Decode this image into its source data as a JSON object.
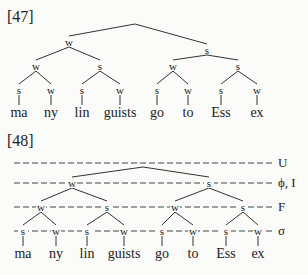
{
  "examples": [
    {
      "label": "[47]",
      "word": [
        "ma",
        "ny",
        "lin",
        "guists",
        "go",
        "to",
        "Ess",
        "ex"
      ],
      "tree": {
        "root": {
          "x": 135,
          "y": 24
        },
        "level1": [
          {
            "label": "w",
            "x": 69,
            "y": 42
          },
          {
            "label": "s",
            "x": 207,
            "y": 50
          }
        ],
        "level2": [
          {
            "label": "w",
            "x": 36,
            "y": 66
          },
          {
            "label": "s",
            "x": 100,
            "y": 66
          },
          {
            "label": "w",
            "x": 173,
            "y": 66
          },
          {
            "label": "s",
            "x": 238,
            "y": 66
          }
        ],
        "level3": [
          {
            "label": "s",
            "x": 19,
            "y": 90
          },
          {
            "label": "w",
            "x": 51,
            "y": 90
          },
          {
            "label": "s",
            "x": 82,
            "y": 90
          },
          {
            "label": "w",
            "x": 120,
            "y": 90
          },
          {
            "label": "s",
            "x": 157,
            "y": 90
          },
          {
            "label": "w",
            "x": 188,
            "y": 90
          },
          {
            "label": "s",
            "x": 221,
            "y": 90
          },
          {
            "label": "w",
            "x": 257,
            "y": 90
          }
        ]
      }
    },
    {
      "label": "[48]",
      "word": [
        "ma",
        "ny",
        "lin",
        "guists",
        "go",
        "to",
        "Ess",
        "ex"
      ],
      "tiers": [
        {
          "label": "U",
          "y": 163
        },
        {
          "label": "ϕ, I",
          "y": 183
        },
        {
          "label": "F",
          "y": 207
        },
        {
          "label": "σ",
          "y": 231
        }
      ],
      "tree": {
        "root": {
          "x": 143,
          "y": 167
        },
        "level1": [
          {
            "label": "w",
            "x": 72,
            "y": 183
          },
          {
            "label": "s",
            "x": 209,
            "y": 183
          }
        ],
        "level2": [
          {
            "label": "w",
            "x": 41,
            "y": 207
          },
          {
            "label": "s",
            "x": 107,
            "y": 207
          },
          {
            "label": "w",
            "x": 175,
            "y": 207
          },
          {
            "label": "s",
            "x": 243,
            "y": 207
          }
        ],
        "level3": [
          {
            "label": "s",
            "x": 23,
            "y": 231
          },
          {
            "label": "w",
            "x": 56,
            "y": 231
          },
          {
            "label": "s",
            "x": 87,
            "y": 231
          },
          {
            "label": "w",
            "x": 124,
            "y": 231
          },
          {
            "label": "s",
            "x": 162,
            "y": 231
          },
          {
            "label": "w",
            "x": 193,
            "y": 231
          },
          {
            "label": "s",
            "x": 226,
            "y": 231
          },
          {
            "label": "w",
            "x": 258,
            "y": 231
          }
        ]
      }
    }
  ]
}
